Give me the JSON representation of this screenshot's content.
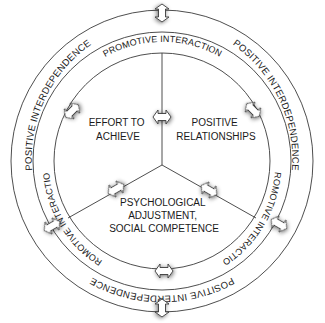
{
  "diagram": {
    "outer_ring": {
      "label": "POSITIVE INTERDEPENDENCE",
      "labels": [
        "POSITIVE INTERDEPENDENCE",
        "POSITIVE INTERDEPENDENCE",
        "POSITIVE INTERDEPENDENCE"
      ]
    },
    "inner_ring": {
      "label": "PROMOTIVE INTERACTION",
      "labels": [
        "PROMOTIVE INTERACTION",
        "PROMOTIVE INTERACTION",
        "PROMOTIVE INTERACTION"
      ]
    },
    "sectors": [
      {
        "id": "effort",
        "lines": [
          "EFFORT TO",
          "ACHIEVE"
        ]
      },
      {
        "id": "relationships",
        "lines": [
          "POSITIVE",
          "RELATIONSHIPS"
        ]
      },
      {
        "id": "psychological",
        "lines": [
          "PSYCHOLOGICAL",
          "ADJUSTMENT,",
          "SOCIAL COMPETENCE"
        ]
      }
    ],
    "arrows": {
      "style": "double-headed block arrow",
      "count": 9
    },
    "colors": {
      "line": "#3a3a3a",
      "text": "#1a1a1a",
      "background": "#ffffff"
    }
  }
}
